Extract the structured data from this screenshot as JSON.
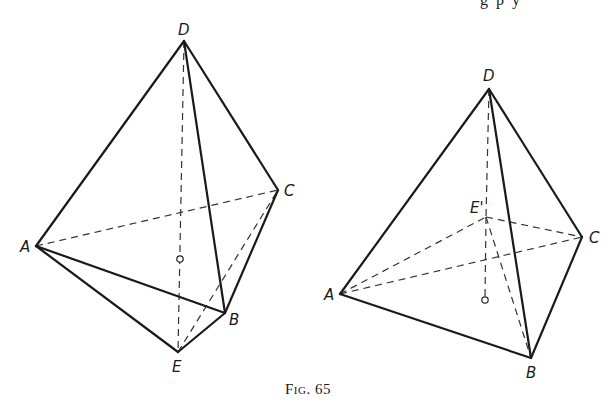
{
  "caption": "Fig. 65",
  "top_text_fragment": "g  p  y",
  "figures": [
    {
      "id": "left",
      "vertices": {
        "D": {
          "label": "D",
          "x": 184,
          "y": 41,
          "lx": 178,
          "ly": 35
        },
        "C": {
          "label": "C",
          "x": 278,
          "y": 190,
          "lx": 284,
          "ly": 196
        },
        "A": {
          "label": "A",
          "x": 36,
          "y": 246,
          "lx": 20,
          "ly": 252
        },
        "B": {
          "label": "B",
          "x": 225,
          "y": 313,
          "lx": 229,
          "ly": 325
        },
        "E": {
          "label": "E",
          "x": 178,
          "y": 352,
          "lx": 172,
          "ly": 372
        }
      },
      "solid_edges": [
        [
          "D",
          "A"
        ],
        [
          "D",
          "C"
        ],
        [
          "D",
          "B"
        ],
        [
          "A",
          "B"
        ],
        [
          "B",
          "C"
        ],
        [
          "A",
          "E"
        ],
        [
          "E",
          "B"
        ]
      ],
      "dashed_edges": [
        [
          "A",
          "C"
        ],
        [
          "D",
          "E"
        ],
        [
          "E",
          "C"
        ]
      ],
      "center_point": {
        "x": 180,
        "y": 259
      }
    },
    {
      "id": "right",
      "vertices": {
        "D": {
          "label": "D",
          "x": 489,
          "y": 89,
          "lx": 483,
          "ly": 81
        },
        "C": {
          "label": "C",
          "x": 582,
          "y": 237,
          "lx": 589,
          "ly": 243
        },
        "A": {
          "label": "A",
          "x": 340,
          "y": 294,
          "lx": 324,
          "ly": 300
        },
        "B": {
          "label": "B",
          "x": 531,
          "y": 358,
          "lx": 526,
          "ly": 378
        },
        "E'": {
          "label": "E'",
          "x": 486,
          "y": 217,
          "lx": 470,
          "ly": 213
        }
      },
      "solid_edges": [
        [
          "D",
          "A"
        ],
        [
          "D",
          "C"
        ],
        [
          "D",
          "B"
        ],
        [
          "A",
          "B"
        ],
        [
          "B",
          "C"
        ]
      ],
      "dashed_edges": [
        [
          "A",
          "C"
        ],
        [
          "A",
          "E'"
        ],
        [
          "E'",
          "C"
        ],
        [
          "E'",
          "B"
        ],
        [
          "D",
          "E'"
        ]
      ],
      "center_point": {
        "x": 485,
        "y": 300
      },
      "center_stem_from": "E'"
    }
  ]
}
